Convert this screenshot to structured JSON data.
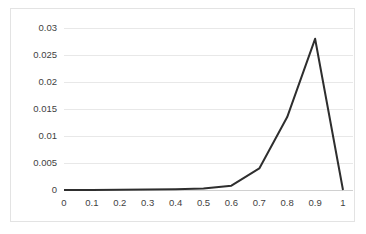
{
  "chart_data": {
    "type": "line",
    "title": "",
    "subtitle": "",
    "xlabel": "",
    "ylabel": "",
    "xlim": [
      0,
      1
    ],
    "ylim": [
      0,
      0.03
    ],
    "grid": "horizontal",
    "legend": "none",
    "line_color": "#2e2e2e",
    "gridline_color": "#e8e8e8",
    "border_color": "#e3e3e3",
    "x": [
      0,
      0.1,
      0.2,
      0.3,
      0.4,
      0.5,
      0.6,
      0.7,
      0.8,
      0.9,
      1
    ],
    "values": [
      0,
      2e-05,
      4e-05,
      8e-05,
      0.00015,
      0.0003,
      0.0008,
      0.004,
      0.0135,
      0.028,
      0
    ],
    "series": [
      {
        "name": "series-1",
        "values": [
          0,
          2e-05,
          4e-05,
          8e-05,
          0.00015,
          0.0003,
          0.0008,
          0.004,
          0.0135,
          0.028,
          0
        ]
      }
    ],
    "xticks": [
      0,
      0.1,
      0.2,
      0.3,
      0.4,
      0.5,
      0.6,
      0.7,
      0.8,
      0.9,
      1
    ],
    "xtick_labels": [
      "0",
      "0.1",
      "0.2",
      "0.3",
      "0.4",
      "0.5",
      "0.6",
      "0.7",
      "0.8",
      "0.9",
      "1"
    ],
    "yticks": [
      0,
      0.005,
      0.01,
      0.015,
      0.02,
      0.025,
      0.03
    ],
    "ytick_labels": [
      "0",
      "0.005",
      "0.01",
      "0.015",
      "0.02",
      "0.025",
      "0.03"
    ]
  }
}
